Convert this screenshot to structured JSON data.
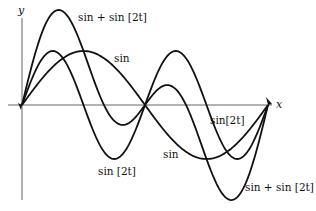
{
  "chart_data": {
    "type": "line",
    "title": "",
    "xlabel": "x",
    "ylabel": "y",
    "xlim": [
      0,
      6.2832
    ],
    "ylim": [
      -1.8,
      1.8
    ],
    "grid": false,
    "series": [
      {
        "name": "sin",
        "expr": "sin(t)",
        "label_text": "sin"
      },
      {
        "name": "sin[2t]",
        "expr": "sin(2t)",
        "label_text": "sin [2t]"
      },
      {
        "name": "sin + sin[2t]",
        "expr": "sin(t)+sin(2t)",
        "label_text": "sin + sin [2t]"
      }
    ],
    "annotations": [
      {
        "text": "sin + sin [2t]",
        "series": "sin + sin[2t]",
        "position": "near top peak"
      },
      {
        "text": "sin",
        "series": "sin",
        "position": "upper right of sin peak"
      },
      {
        "text": "sin[2t]",
        "series": "sin[2t]",
        "position": "below x-axis right"
      },
      {
        "text": "sin",
        "series": "sin",
        "position": "below x-axis center"
      },
      {
        "text": "sin [2t]",
        "series": "sin[2t]",
        "position": "below first trough"
      },
      {
        "text": "sin + sin [2t]",
        "series": "sin + sin[2t]",
        "position": "bottom right"
      }
    ]
  },
  "labels": {
    "y_axis": "y",
    "x_axis": "x",
    "sum_top": "sin + sin [2t]",
    "sin_top": "sin",
    "sin2_right": "sin[2t]",
    "sin_mid": "sin",
    "sin2_bottom": "sin [2t]",
    "sum_bottom": "sin + sin [2t]"
  }
}
